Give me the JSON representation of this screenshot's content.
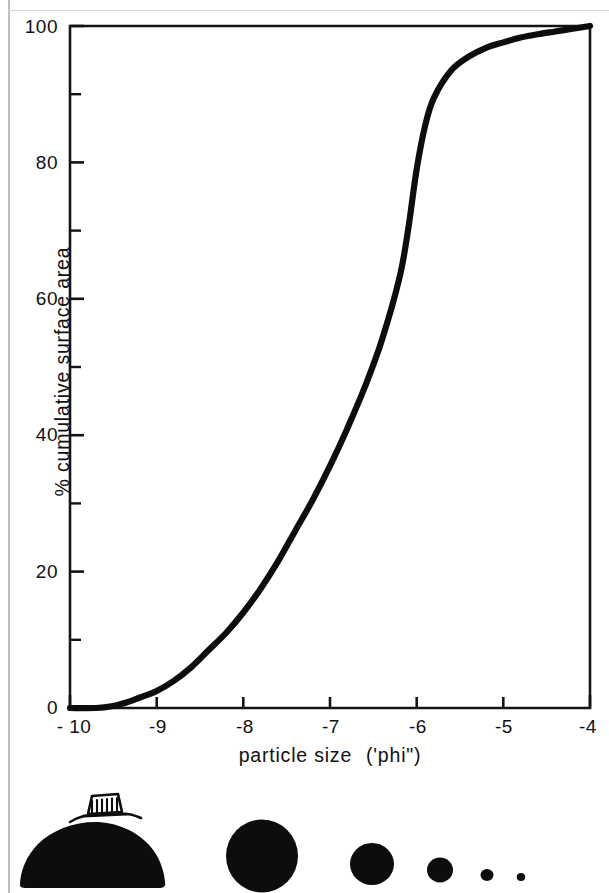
{
  "figure": {
    "kind": "cumulative-curve-with-scale-silhouettes"
  },
  "axes": {
    "y_title": "% cumulative surface area",
    "x_title_main": "particle size",
    "x_title_paren": "('phi\")",
    "y_ticks": [
      "100",
      "80",
      "60",
      "40",
      "20",
      "0"
    ],
    "x_ticks": [
      "- 10",
      "-9",
      "-8",
      "-7",
      "-6",
      "-5",
      "-4"
    ]
  },
  "silhouettes": {
    "scale_object": "house-sketch",
    "count": 6,
    "note": "boulder-to-pebble size series"
  },
  "chart_data": {
    "type": "line",
    "title": "",
    "subtitle": "",
    "xlabel": "particle size ('phi\")",
    "ylabel": "% cumulative surface area",
    "xlim": [
      -10,
      -4
    ],
    "ylim": [
      0,
      100
    ],
    "xticks": [
      -10,
      -9,
      -8,
      -7,
      -6,
      -5,
      -4
    ],
    "xticklabels": [
      "- 10",
      "-9",
      "-8",
      "-7",
      "-6",
      "-5",
      "-4"
    ],
    "yticks": [
      0,
      20,
      40,
      60,
      80,
      100
    ],
    "yticklabels": [
      "0",
      "20",
      "40",
      "60",
      "80",
      "100"
    ],
    "y_minor_ticks": [
      10,
      30,
      50,
      70,
      90
    ],
    "grid": false,
    "legend": null,
    "annotations": [],
    "series": [
      {
        "name": "cumulative surface area",
        "x": [
          -10.0,
          -9.7,
          -9.5,
          -9.35,
          -9.2,
          -9.0,
          -8.8,
          -8.6,
          -8.4,
          -8.2,
          -8.0,
          -7.8,
          -7.6,
          -7.4,
          -7.2,
          -7.0,
          -6.8,
          -6.6,
          -6.4,
          -6.2,
          -6.1,
          -6.0,
          -5.9,
          -5.8,
          -5.6,
          -5.4,
          -5.2,
          -5.0,
          -4.8,
          -4.6,
          -4.4,
          -4.2,
          -4.0
        ],
        "y": [
          0.0,
          0.0,
          0.3,
          0.8,
          1.5,
          2.5,
          4.0,
          6.0,
          8.5,
          11.0,
          14.0,
          17.5,
          21.5,
          26.0,
          30.5,
          35.5,
          41.0,
          47.0,
          54.0,
          63.0,
          70.0,
          79.0,
          85.5,
          89.5,
          93.5,
          95.5,
          96.8,
          97.6,
          98.3,
          98.8,
          99.2,
          99.6,
          100.0
        ]
      }
    ]
  }
}
